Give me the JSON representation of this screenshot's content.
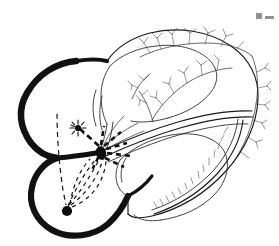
{
  "figure": {
    "kind": "anatomical line drawing",
    "background_color": "#ffffff",
    "ink_color": "#111111"
  },
  "corner": {
    "mark_label": "page-edge artifact",
    "mark_a": "",
    "mark_b": ""
  },
  "structures": {
    "major_vessel_label": "thick black coronary vessel",
    "chamber_upper_label": "upper chamber outline",
    "chamber_lower_label": "lower chamber outline",
    "apex_label": "apex",
    "vessel_tree_label": "branching coronary arterial tree",
    "comb_vessel_label": "marginal vessel with comb branches"
  },
  "markers": {
    "focus": {
      "name": "starburst focus point",
      "cx": 78,
      "cy": 128,
      "r": 3.0,
      "ray_count": 9,
      "ray_len": 7,
      "color": "#0d0d0d"
    },
    "center_node": {
      "name": "central conduction node",
      "cx": 101,
      "cy": 152,
      "rx": 5.2,
      "ry": 6.6,
      "color": "#0d0d0d"
    },
    "apex_node": {
      "name": "apical node",
      "cx": 67,
      "cy": 211,
      "r": 5.0,
      "color": "#0d0d0d"
    }
  },
  "pathways": {
    "dashed_vertical_label": "dashed vertical guide line",
    "dashed_fan_label": "dashed fan of conduction pathways",
    "dashed_arrow_label": "dashed directional arrows",
    "arrow_count": 6,
    "fan_count": 5,
    "dash_pattern_fine": "4 4",
    "dash_pattern_bold": "5 4"
  },
  "colors": {
    "ink": "#111111",
    "mid": "#2a2a2a",
    "light": "#333333",
    "paper": "#ffffff"
  }
}
